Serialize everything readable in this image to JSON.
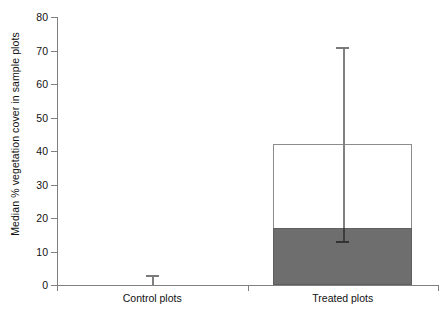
{
  "chart_data": {
    "type": "bar",
    "title": "",
    "xlabel": "",
    "ylabel": "Median % vegetation cover in sample plots",
    "categories": [
      "Control plots",
      "Treated plots"
    ],
    "ylim": [
      0,
      80
    ],
    "yticks": [
      0,
      10,
      20,
      30,
      40,
      50,
      60,
      70,
      80
    ],
    "grid": false,
    "legend": null,
    "series": [
      {
        "name": "Median % vegetation cover (lower/filled segment)",
        "values": [
          0,
          17
        ]
      },
      {
        "name": "Upper bar extent (total, open segment top)",
        "values": [
          0,
          42
        ]
      }
    ],
    "error_bars": [
      {
        "category": "Control plots",
        "lower": 0,
        "upper": 3
      },
      {
        "category": "Treated plots",
        "lower": 13,
        "upper": 71
      }
    ]
  },
  "axes": {
    "y_title": "Median % vegetation cover in sample plots",
    "y_tick_labels": [
      "0",
      "10",
      "20",
      "30",
      "40",
      "50",
      "60",
      "70",
      "80"
    ],
    "x_tick_labels": [
      "Control plots",
      "Treated plots"
    ]
  },
  "colors": {
    "bar_fill": "#6e6e6e",
    "bar_outline": "#8c8c8c",
    "axis": "#808080",
    "error_bar": "#7a7a7a",
    "background": "#ffffff",
    "text": "#111111"
  }
}
